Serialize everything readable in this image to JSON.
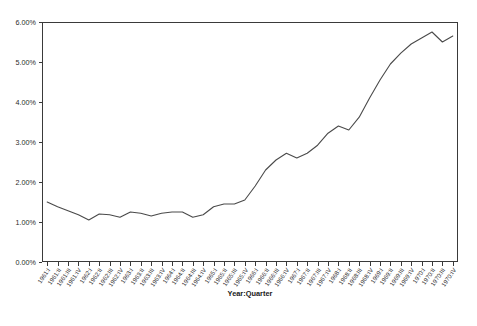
{
  "chart_data": {
    "type": "line",
    "title": "",
    "subtitle": "",
    "xlabel": "Year:Quarter",
    "ylabel": "",
    "grid": false,
    "legend": false,
    "legend_position": "none",
    "xlim": [
      "1961:I",
      "1970:IV"
    ],
    "ylim": [
      0,
      6
    ],
    "yunit": "%",
    "ytick_labels": [
      "0.00%",
      "1.00%",
      "2.00%",
      "3.00%",
      "4.00%",
      "5.00%",
      "6.00%"
    ],
    "ytick_values": [
      0,
      1,
      2,
      3,
      4,
      5,
      6
    ],
    "categories": [
      "1961:I",
      "1961:II",
      "1961:III",
      "1961:IV",
      "1962:I",
      "1962:II",
      "1962:III",
      "1962:IV",
      "1963:I",
      "1963:II",
      "1963:III",
      "1963:IV",
      "1964:I",
      "1964:II",
      "1964:III",
      "1964:IV",
      "1965:I",
      "1965:II",
      "1965:III",
      "1965:IV",
      "1966:I",
      "1966:II",
      "1966:III",
      "1966:IV",
      "1967:I",
      "1967:II",
      "1967:III",
      "1967:IV",
      "1968:I",
      "1968:II",
      "1968:III",
      "1968:IV",
      "1969:I",
      "1969:II",
      "1969:III",
      "1969:IV",
      "1970:I",
      "1970:II",
      "1970:III",
      "1970:IV"
    ],
    "values": [
      1.5,
      1.38,
      1.28,
      1.18,
      1.05,
      1.2,
      1.18,
      1.12,
      1.25,
      1.22,
      1.15,
      1.22,
      1.25,
      1.25,
      1.12,
      1.18,
      1.38,
      1.45,
      1.45,
      1.55,
      1.9,
      2.3,
      2.55,
      2.72,
      2.6,
      2.72,
      2.92,
      3.22,
      3.4,
      3.3,
      3.62,
      4.1,
      4.55,
      4.95,
      5.22,
      5.45,
      5.6,
      5.75,
      5.5,
      5.65
    ],
    "line_color": "#4a4a4a",
    "axis_color": "#3a3a3a",
    "background_color": "#ffffff",
    "xtick_label_rotation": -55
  },
  "plot": {
    "left": 42,
    "right": 458,
    "top": 22,
    "bottom": 262
  }
}
